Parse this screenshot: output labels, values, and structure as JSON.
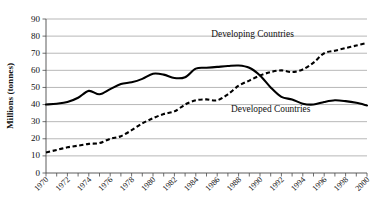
{
  "chart_data": {
    "type": "line",
    "title": "",
    "xlabel": "",
    "ylabel": "Millions (tonnes)",
    "ylim": [
      0,
      90
    ],
    "ystep": 10,
    "xlim": [
      1970,
      2000
    ],
    "grid": true,
    "legend_position": "inline-annotation",
    "ytick_labels": [
      "0",
      "10",
      "20",
      "30",
      "40",
      "50",
      "60",
      "70",
      "80",
      "90"
    ],
    "xtick_labels": [
      "1970",
      "1972",
      "1974",
      "1976",
      "1978",
      "1980",
      "1982",
      "1984",
      "1986",
      "1988",
      "1990",
      "1992",
      "1994",
      "1996",
      "1998",
      "2000"
    ],
    "x": [
      1970,
      1971,
      1972,
      1973,
      1974,
      1975,
      1976,
      1977,
      1978,
      1979,
      1980,
      1981,
      1982,
      1983,
      1984,
      1985,
      1986,
      1987,
      1988,
      1989,
      1990,
      1991,
      1992,
      1993,
      1994,
      1995,
      1996,
      1997,
      1998,
      1999,
      2000
    ],
    "series": [
      {
        "name": "Developed Countries",
        "style": "solid",
        "annotation": "Developed Countries",
        "values": [
          40,
          40.5,
          41.5,
          44,
          48,
          46,
          49,
          52,
          53,
          55,
          58,
          57.5,
          55.5,
          56,
          61,
          61.5,
          62,
          62.5,
          62.8,
          61.5,
          57,
          50,
          44.5,
          43,
          40.5,
          40,
          41.5,
          42.5,
          42,
          41,
          39.5
        ]
      },
      {
        "name": "Developing Countries",
        "style": "dashed",
        "annotation": "Developing Countries",
        "values": [
          12,
          13.5,
          15,
          16,
          17,
          17.5,
          20,
          21.5,
          25,
          29,
          32,
          34.5,
          36,
          40,
          42.5,
          43,
          42.5,
          46,
          51,
          54,
          57,
          59,
          60,
          59,
          60.5,
          64.5,
          70,
          71.5,
          73,
          74.5,
          76
        ]
      }
    ],
    "annotations": [
      {
        "text": "Developing Countries",
        "x": 1989.3,
        "y": 79.5
      },
      {
        "text": "Developed Countries",
        "x": 1991.0,
        "y": 35.5
      }
    ]
  }
}
